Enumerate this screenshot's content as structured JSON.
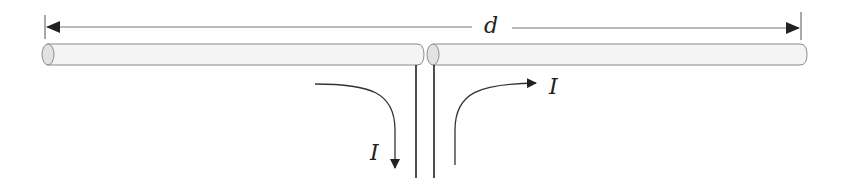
{
  "diagram": {
    "dimension": {
      "label": "d",
      "x_start": 45,
      "x_end": 801,
      "y": 27
    },
    "rods": [
      {
        "name": "left-arm",
        "x1": 42,
        "x2": 423,
        "y_top": 44,
        "y_bottom": 65
      },
      {
        "name": "right-arm",
        "x1": 428,
        "x2": 806,
        "y_top": 44,
        "y_bottom": 65
      }
    ],
    "feed_lines": [
      {
        "name": "left-feed",
        "x": 416,
        "y1": 65,
        "y2": 178
      },
      {
        "name": "right-feed",
        "x": 434,
        "y1": 65,
        "y2": 178
      }
    ],
    "currents": [
      {
        "name": "current-into-feed",
        "label": "I",
        "direction": "down"
      },
      {
        "name": "current-out-of-feed",
        "label": "I",
        "direction": "right"
      }
    ],
    "colors": {
      "rod_fill": "#f4f4f4",
      "rod_end_fill": "#e2e2e2",
      "rod_stroke": "#8a8a8a",
      "line": "#333333"
    }
  }
}
